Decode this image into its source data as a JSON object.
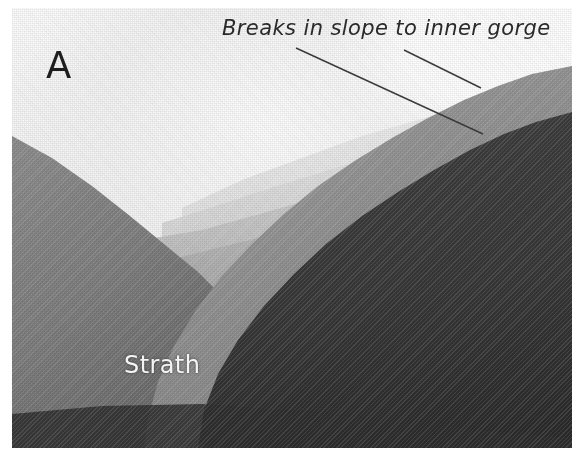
{
  "figure": {
    "panel_letter": "A",
    "width": 585,
    "height": 465,
    "background_color": "#ffffff"
  },
  "annotations": {
    "break_label": {
      "text": "Breaks in slope to inner gorge",
      "color": "#2a2a2a",
      "style": "handwritten-italic",
      "leader_count": 2
    },
    "strath_label": {
      "text": "Strath",
      "color": "#f4f4f4",
      "style": "handwritten",
      "placed_on": "valley-floor"
    }
  },
  "leader_lines": [
    {
      "name": "leader-upper-break",
      "x1": 404,
      "y1": 50,
      "x2": 481,
      "y2": 88,
      "color": "#3a3a3a"
    },
    {
      "name": "leader-lower-break",
      "x1": 296,
      "y1": 48,
      "x2": 483,
      "y2": 134,
      "color": "#3a3a3a"
    }
  ],
  "photograph": {
    "subject": "steep forested mountain valley with inner gorge",
    "frame": {
      "left": 12,
      "top": 8,
      "width": 560,
      "height": 440
    },
    "tones": {
      "sky_glare": "#ffffff",
      "haze_far": "#e3e3e3",
      "ridge_distant": "#d2d2d2",
      "ridge_mid": "#b4b4b4",
      "ridge_near_right": "#8d8d8d",
      "slope_left": "#7e7e7e",
      "valley_floor": "#5a5a5a",
      "gorge_shadow": "#3c3c3c",
      "foreground_dark": "#2f2f2f"
    },
    "features": [
      {
        "name": "left-valley-wall",
        "tone": "#7e7e7e",
        "note": "descends left to right from upper-left peak"
      },
      {
        "name": "distant-ridge-stack",
        "tone": "#d2d2d2",
        "note": "nested hazy ridges in valley centre"
      },
      {
        "name": "upper-slope-break",
        "tone": "#8d8d8d",
        "note": "mid-gray bench marked by upper leader"
      },
      {
        "name": "inner-gorge-break",
        "tone": "#3c3c3c",
        "note": "dark steep wall marked by lower leader"
      },
      {
        "name": "strath-floor",
        "tone": "#5a5a5a",
        "note": "broad flat valley floor bearing Strath label"
      }
    ]
  }
}
